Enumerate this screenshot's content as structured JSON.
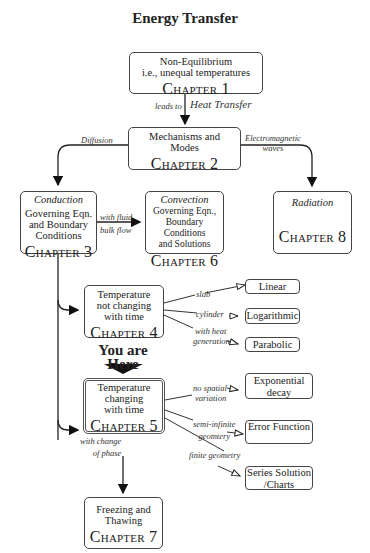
{
  "title": "Energy Transfer",
  "nodes": {
    "ch1": {
      "lines": [
        "Non-Equilibrium",
        "i.e., unequal temperatures"
      ],
      "chapter": "Chapter 1"
    },
    "ch2": {
      "lines": [
        "Mechanisms and",
        "Modes"
      ],
      "chapter": "Chapter 2"
    },
    "ch3": {
      "heading": "Conduction",
      "lines": [
        "Governing Eqn.",
        "and Boundary",
        "Conditions"
      ],
      "chapter": "Chapter 3"
    },
    "ch6": {
      "heading": "Convection",
      "lines": [
        "Governing Eqn.,",
        "Boundary Conditions",
        "and Solutions"
      ],
      "chapter": "Chapter 6"
    },
    "ch8": {
      "heading": "Radiation",
      "chapter": "Chapter 8"
    },
    "ch4": {
      "lines": [
        "Temperature",
        "not changing",
        "with time"
      ],
      "chapter": "Chapter 4"
    },
    "ch5": {
      "lines": [
        "Temperature",
        "changing",
        "with time"
      ],
      "chapter": "Chapter 5"
    },
    "ch7": {
      "lines": [
        "Freezing and",
        "Thawing"
      ],
      "chapter": "Chapter 7"
    }
  },
  "results": {
    "linear": "Linear",
    "logarithmic": "Logarithmic",
    "parabolic": "Parabolic",
    "exponential": [
      "Exponential",
      "decay"
    ],
    "error": [
      "Error",
      "Function"
    ],
    "series": [
      "Series Solution",
      "/Charts"
    ]
  },
  "edge_labels": {
    "leads_to": "leads to",
    "heat_transfer": "Heat Transfer",
    "diffusion": "Diffusion",
    "electromagnetic": [
      "Electromagnetic",
      "waves"
    ],
    "fluid_flow": [
      "with fluid",
      "bulk flow"
    ],
    "slab": "slab",
    "cylinder": "cylinder",
    "heat_gen": [
      "with heat",
      "generation"
    ],
    "no_spatial": [
      "no spatial",
      "variation"
    ],
    "semi_infinite": [
      "semi-infinite",
      "geomtery"
    ],
    "finite": "finite geometry",
    "phase_change": [
      "with change",
      "of phase"
    ]
  },
  "marker": {
    "line1": "You",
    "line2": "are Here"
  }
}
